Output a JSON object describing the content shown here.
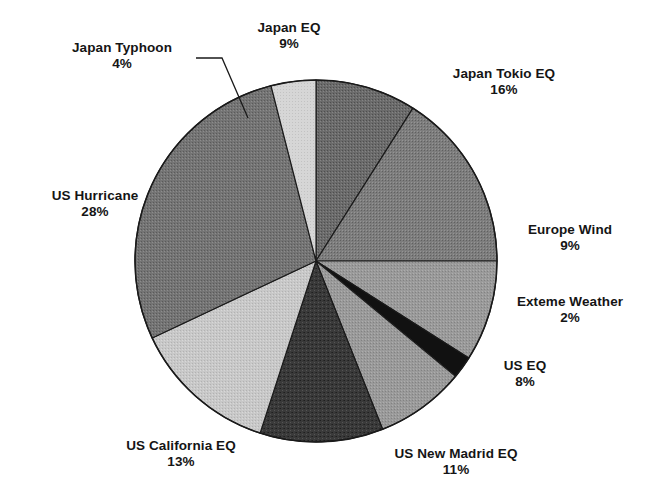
{
  "chart_data": {
    "type": "pie",
    "title": "",
    "subtitle": "",
    "xlabel": "",
    "ylabel": "",
    "legend_position": "none",
    "grid": false,
    "label_format": "name + percent",
    "start_angle_deg": 0,
    "direction": "clockwise",
    "categories": [
      "Japan EQ",
      "Japan Tokio EQ",
      "Europe Wind",
      "Exteme Weather",
      "US EQ",
      "US New Madrid EQ",
      "US California EQ",
      "US Hurricane",
      "Japan Typhoon"
    ],
    "values": [
      9,
      16,
      9,
      2,
      8,
      11,
      13,
      28,
      4
    ],
    "total": 100,
    "units": "percent",
    "slices": [
      {
        "key": "japan_eq",
        "label": "Japan EQ",
        "percent_text": "9%",
        "value": 9,
        "fill": "#6b6b6b",
        "pattern": "halftone-dark"
      },
      {
        "key": "japan_tokio_eq",
        "label": "Japan Tokio EQ",
        "percent_text": "16%",
        "value": 16,
        "fill": "#7d7d7d",
        "pattern": "halftone-medium-dark"
      },
      {
        "key": "europe_wind",
        "label": "Europe Wind",
        "percent_text": "9%",
        "value": 9,
        "fill": "#9a9a9a",
        "pattern": "halftone-medium"
      },
      {
        "key": "exteme_weather",
        "label": "Exteme Weather",
        "percent_text": "2%",
        "value": 2,
        "fill": "#111111",
        "pattern": "solid-black"
      },
      {
        "key": "us_eq",
        "label": "US EQ",
        "percent_text": "8%",
        "value": 8,
        "fill": "#9a9a9a",
        "pattern": "halftone-medium"
      },
      {
        "key": "us_new_madrid_eq",
        "label": "US New Madrid EQ",
        "percent_text": "11%",
        "value": 11,
        "fill": "#3a3a3a",
        "pattern": "halftone-very-dark"
      },
      {
        "key": "us_california_eq",
        "label": "US California EQ",
        "percent_text": "13%",
        "value": 13,
        "fill": "#c6c6c6",
        "pattern": "halftone-light"
      },
      {
        "key": "us_hurricane",
        "label": "US Hurricane",
        "percent_text": "28%",
        "value": 28,
        "fill": "#747474",
        "pattern": "halftone-medium-dark"
      },
      {
        "key": "japan_typhoon",
        "label": "Japan Typhoon",
        "percent_text": "4%",
        "value": 4,
        "fill": "#d4d4d4",
        "pattern": "halftone-very-light"
      }
    ],
    "colors": {
      "outline": "#1a1a1a",
      "background": "#ffffff",
      "text": "#151515",
      "leader_line": "#1a1a1a"
    },
    "annotations": [
      {
        "key": "japan_typhoon_leader",
        "for": "Japan Typhoon",
        "type": "leader-line"
      }
    ]
  }
}
